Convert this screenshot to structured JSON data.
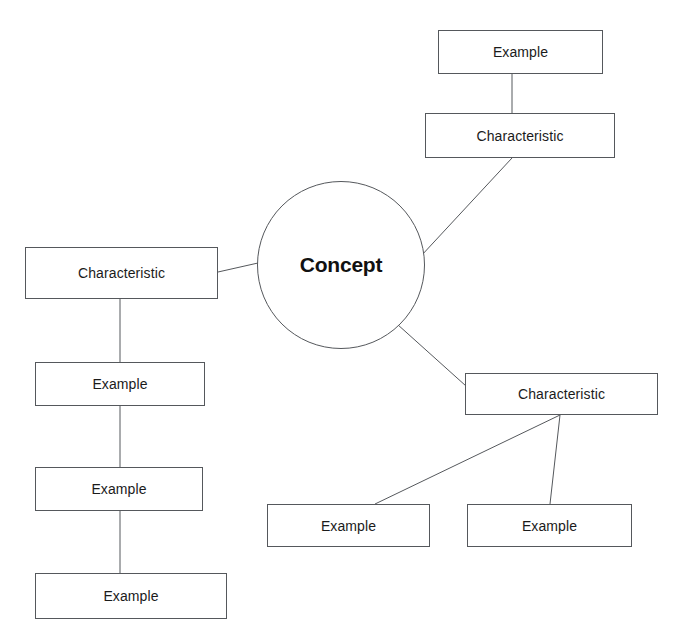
{
  "diagram": {
    "type": "concept-map",
    "title_text": "Concept",
    "canvas": {
      "width": 681,
      "height": 638,
      "background": "#ffffff"
    },
    "style": {
      "stroke": "#55585c",
      "text_color": "#1b1b1b",
      "stroke_width": 1
    },
    "nodes": [
      {
        "id": "concept",
        "label": "Concept",
        "shape": "circle",
        "cx": 341,
        "cy": 265,
        "r": 84
      },
      {
        "id": "example_top",
        "label": "Example",
        "shape": "rect",
        "x": 438,
        "y": 30,
        "w": 165,
        "h": 44
      },
      {
        "id": "characteristic_top",
        "label": "Characteristic",
        "shape": "rect",
        "x": 425,
        "y": 113,
        "w": 190,
        "h": 45
      },
      {
        "id": "characteristic_left",
        "label": "Characteristic",
        "shape": "rect",
        "x": 25,
        "y": 247,
        "w": 193,
        "h": 52
      },
      {
        "id": "example_left_1",
        "label": "Example",
        "shape": "rect",
        "x": 35,
        "y": 362,
        "w": 170,
        "h": 44
      },
      {
        "id": "example_left_2",
        "label": "Example",
        "shape": "rect",
        "x": 35,
        "y": 467,
        "w": 168,
        "h": 44
      },
      {
        "id": "example_left_3",
        "label": "Example",
        "shape": "rect",
        "x": 35,
        "y": 573,
        "w": 192,
        "h": 46
      },
      {
        "id": "characteristic_right",
        "label": "Characteristic",
        "shape": "rect",
        "x": 465,
        "y": 373,
        "w": 193,
        "h": 42
      },
      {
        "id": "example_right_1",
        "label": "Example",
        "shape": "rect",
        "x": 267,
        "y": 504,
        "w": 163,
        "h": 43
      },
      {
        "id": "example_right_2",
        "label": "Example",
        "shape": "rect",
        "x": 467,
        "y": 504,
        "w": 165,
        "h": 43
      }
    ],
    "edges": [
      {
        "id": "edge-example-top-to-characteristic-top",
        "from": "example_top",
        "to": "characteristic_top",
        "x1": 512,
        "y1": 74,
        "x2": 512,
        "y2": 113
      },
      {
        "id": "edge-characteristic-top-to-concept",
        "from": "characteristic_top",
        "to": "concept",
        "x1": 512,
        "y1": 158,
        "x2": 421,
        "y2": 256
      },
      {
        "id": "edge-concept-to-characteristic-left",
        "from": "concept",
        "to": "characteristic_left",
        "x1": 258,
        "y1": 263,
        "x2": 218,
        "y2": 272
      },
      {
        "id": "edge-characteristic-left-to-example-left-1",
        "from": "characteristic_left",
        "to": "example_left_1",
        "x1": 120,
        "y1": 299,
        "x2": 120,
        "y2": 362
      },
      {
        "id": "edge-example-left-1-to-example-left-2",
        "from": "example_left_1",
        "to": "example_left_2",
        "x1": 120,
        "y1": 406,
        "x2": 120,
        "y2": 467
      },
      {
        "id": "edge-example-left-2-to-example-left-3",
        "from": "example_left_2",
        "to": "example_left_3",
        "x1": 120,
        "y1": 511,
        "x2": 120,
        "y2": 573
      },
      {
        "id": "edge-concept-to-characteristic-right",
        "from": "concept",
        "to": "characteristic_right",
        "x1": 397,
        "y1": 324,
        "x2": 466,
        "y2": 386
      },
      {
        "id": "edge-characteristic-right-to-example-right-1",
        "from": "characteristic_right",
        "to": "example_right_1",
        "x1": 560,
        "y1": 415,
        "x2": 375,
        "y2": 504
      },
      {
        "id": "edge-characteristic-right-to-example-right-2",
        "from": "characteristic_right",
        "to": "example_right_2",
        "x1": 560,
        "y1": 415,
        "x2": 550,
        "y2": 504
      }
    ]
  }
}
